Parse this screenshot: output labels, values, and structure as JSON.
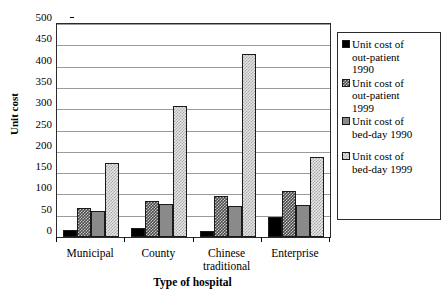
{
  "chart_data": {
    "type": "bar",
    "title": "",
    "subtitle": "",
    "xlabel": "Type of hospital",
    "ylabel": "Unit cost",
    "categories": [
      "Municipal",
      "County",
      "Chinese\ntraditional",
      "Enterprise"
    ],
    "ylim": [
      0,
      500
    ],
    "ytick_step": 50,
    "yticks": [
      "500",
      "450",
      "400",
      "350",
      "300",
      "250",
      "200",
      "150",
      "100",
      "50",
      "0"
    ],
    "grid": true,
    "legend_position": "right",
    "series": [
      {
        "name": "Unit cost of\nout-patient\n1990",
        "pattern": "solid-black",
        "color": "#000000",
        "values": [
          17,
          21,
          15,
          46
        ]
      },
      {
        "name": "Unit cost of\nout-patient\n1999",
        "pattern": "dark-checker",
        "color": "#4a4a4a",
        "values": [
          67,
          85,
          96,
          109
        ]
      },
      {
        "name": "Unit cost of\nbed-day 1990",
        "pattern": "solid-gray",
        "color": "#8a8a8a",
        "values": [
          62,
          78,
          73,
          75
        ]
      },
      {
        "name": "Unit cost of\nbed-day 1999",
        "pattern": "light-checker",
        "color": "#e6e6e6",
        "values": [
          174,
          308,
          430,
          187
        ]
      }
    ]
  },
  "legend": {
    "items": [
      "Unit cost of\nout-patient\n1990",
      "Unit cost of\nout-patient\n1999",
      "Unit cost of\nbed-day 1990",
      "Unit cost of\nbed-day 1999"
    ]
  },
  "axes": {
    "y_title": "Unit cost",
    "x_title": "Type of hospital"
  }
}
